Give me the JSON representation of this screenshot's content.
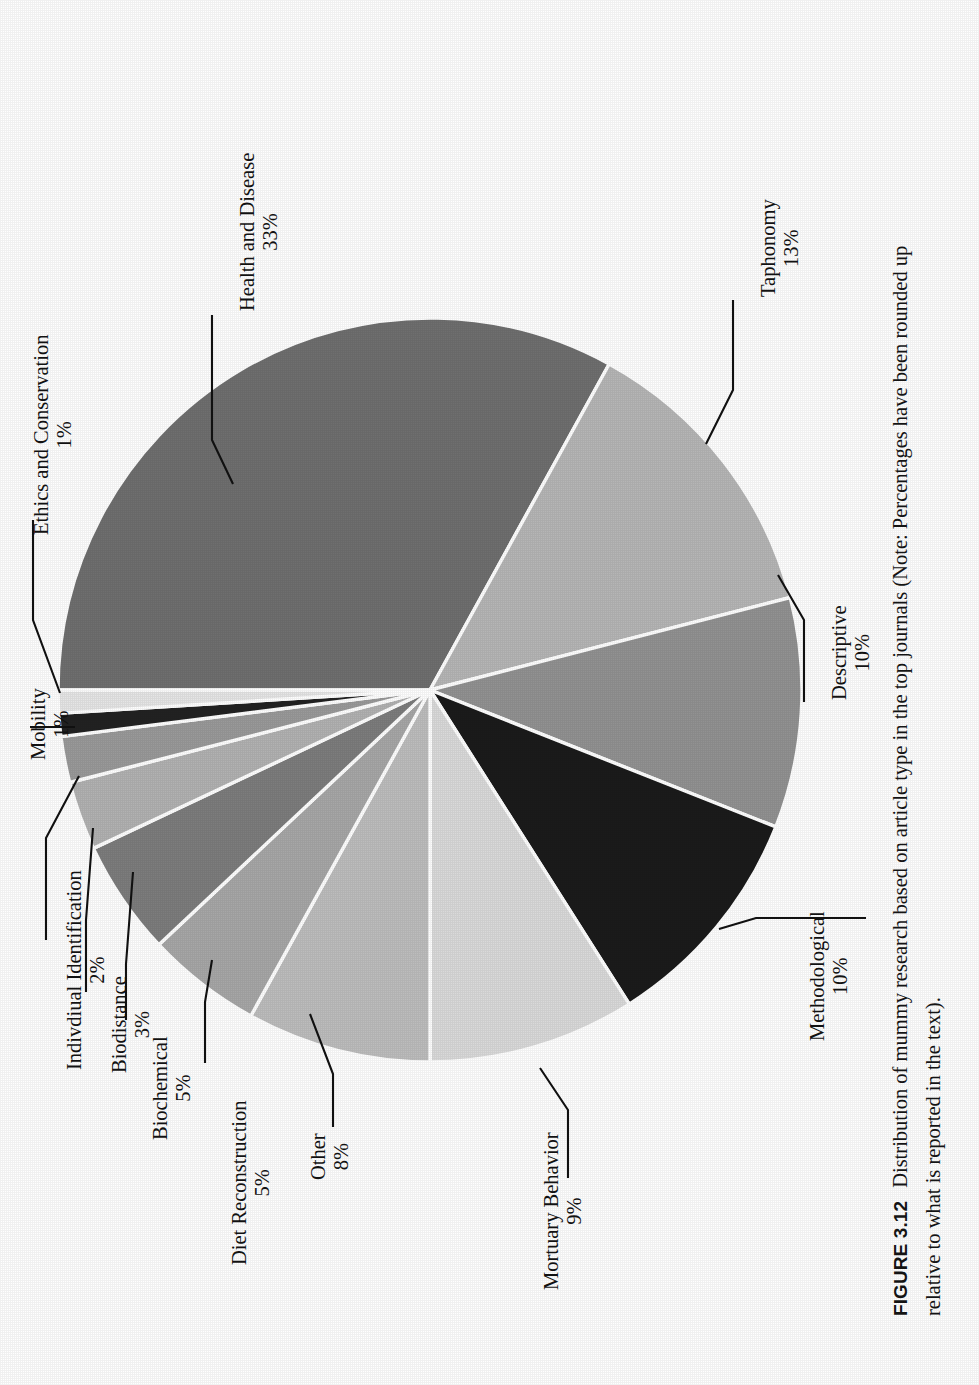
{
  "figure": {
    "number": "FIGURE 3.12",
    "caption": "Distribution of mummy research based on article type in the top journals (Note: Percentages have been rounded up relative to what is reported in the text)."
  },
  "chart_data": {
    "type": "pie",
    "title": "Distribution of mummy research based on article type in the top journals",
    "xlabel": "",
    "ylabel": "",
    "legend": "none (direct leader-line labels)",
    "grid": false,
    "units": "percent",
    "total": 100,
    "rotation_deg": -90,
    "start_angle_deg": 0,
    "direction": "clockwise",
    "categories": [
      "Health and Disease",
      "Taphonomy",
      "Descriptive",
      "Methodological",
      "Mortuary Behavior",
      "Other",
      "Diet Reconstruction",
      "Biochemical",
      "Biodistance",
      "Indivdiual Identification",
      "Mobility",
      "Ethics and Conservation"
    ],
    "values": [
      33,
      13,
      10,
      10,
      9,
      8,
      5,
      5,
      3,
      2,
      1,
      1
    ],
    "colors": [
      "#6f6f6f",
      "#b6b6b6",
      "#929292",
      "#1b1b1b",
      "#dadada",
      "#bdbdbd",
      "#a7a7a7",
      "#7d7d7d",
      "#b2b2b2",
      "#9a9a9a",
      "#222222",
      "#e6e6e6"
    ],
    "slice_border": "#ffffff",
    "slices": [
      {
        "label": "Health and Disease",
        "value": 33,
        "percent_text": "33%",
        "color": "#6f6f6f"
      },
      {
        "label": "Taphonomy",
        "value": 13,
        "percent_text": "13%",
        "color": "#b6b6b6"
      },
      {
        "label": "Descriptive",
        "value": 10,
        "percent_text": "10%",
        "color": "#929292"
      },
      {
        "label": "Methodological",
        "value": 10,
        "percent_text": "10%",
        "color": "#1b1b1b"
      },
      {
        "label": "Mortuary Behavior",
        "value": 9,
        "percent_text": "9%",
        "color": "#dadada"
      },
      {
        "label": "Other",
        "value": 8,
        "percent_text": "8%",
        "color": "#bdbdbd"
      },
      {
        "label": "Diet Reconstruction",
        "value": 5,
        "percent_text": "5%",
        "color": "#a7a7a7"
      },
      {
        "label": "Biochemical",
        "value": 5,
        "percent_text": "5%",
        "color": "#7d7d7d"
      },
      {
        "label": "Biodistance",
        "value": 3,
        "percent_text": "3%",
        "color": "#b2b2b2"
      },
      {
        "label": "Indivdiual Identification",
        "value": 2,
        "percent_text": "2%",
        "color": "#9a9a9a"
      },
      {
        "label": "Mobility",
        "value": 1,
        "percent_text": "1%",
        "color": "#222222"
      },
      {
        "label": "Ethics and Conservation",
        "value": 1,
        "percent_text": "1%",
        "color": "#e6e6e6"
      }
    ]
  },
  "labels": {
    "health_and_disease": {
      "name": "Health and Disease",
      "pct": "33%"
    },
    "taphonomy": {
      "name": "Taphonomy",
      "pct": "13%"
    },
    "descriptive": {
      "name": "Descriptive",
      "pct": "10%"
    },
    "methodological": {
      "name": "Methodological",
      "pct": "10%"
    },
    "mortuary_behavior": {
      "name": "Mortuary Behavior",
      "pct": "9%"
    },
    "other": {
      "name": "Other",
      "pct": "8%"
    },
    "diet_reconstruction": {
      "name": "Diet Reconstruction",
      "pct": "5%"
    },
    "biochemical": {
      "name": "Biochemical",
      "pct": "5%"
    },
    "biodistance": {
      "name": "Biodistance",
      "pct": "3%"
    },
    "individual_identification": {
      "name": "Indivdiual Identification",
      "pct": "2%"
    },
    "mobility": {
      "name": "Mobility",
      "pct": "1%"
    },
    "ethics_and_conservation": {
      "name": "Ethics and Conservation",
      "pct": "1%"
    }
  }
}
